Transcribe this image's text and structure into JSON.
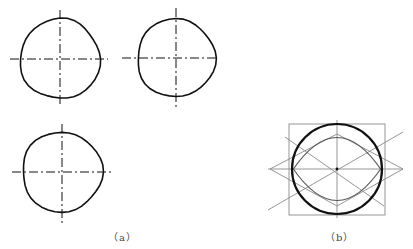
{
  "figure": {
    "colors": {
      "background": "#ffffff",
      "stroke_main": "#111111",
      "stroke_construct": "#8a8a8a",
      "caption": "#444444"
    },
    "panel_a": {
      "label": "（a）",
      "circles": [
        {
          "cx": 60,
          "cy": 59,
          "r": 40,
          "h_axis": [
            10,
            108
          ],
          "v_axis": [
            10,
            107
          ]
        },
        {
          "cx": 176,
          "cy": 58,
          "r": 39,
          "h_axis": [
            122,
            216
          ],
          "v_axis": [
            8,
            108
          ]
        },
        {
          "cx": 62,
          "cy": 172,
          "r": 40,
          "h_axis": [
            12,
            111
          ],
          "v_axis": [
            124,
            224
          ]
        }
      ]
    },
    "panel_b": {
      "label": "（b）",
      "center": {
        "x": 337,
        "y": 169
      },
      "circle_r": 45,
      "square": {
        "x1": 289,
        "y1": 124,
        "x2": 385,
        "y2": 215
      },
      "rhombus": {
        "left": [
          270,
          169
        ],
        "top": [
          337,
          134
        ],
        "right": [
          403,
          169
        ],
        "bottom": [
          337,
          206
        ]
      },
      "diagonals": [
        [
          268,
          210,
          403,
          132
        ],
        [
          285,
          137,
          384,
          206
        ]
      ],
      "axes": {
        "h": [
          268,
          403
        ],
        "v": [
          120,
          218
        ]
      }
    }
  }
}
